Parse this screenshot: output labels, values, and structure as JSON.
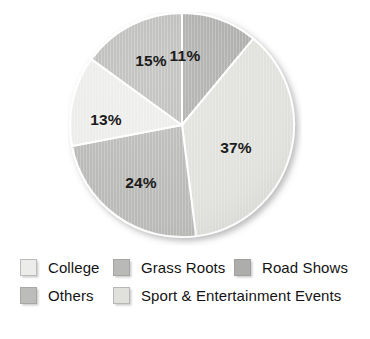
{
  "chart_data": {
    "type": "pie",
    "title": "",
    "subtitle": "",
    "xlabel": "",
    "ylabel": "",
    "grid": false,
    "legend_position": "bottom",
    "start_angle_deg": 0,
    "direction": "clockwise",
    "total": 100,
    "value_unit": "%",
    "categories": [
      "Road Shows",
      "Sport & Entertainment Events",
      "Grass Roots",
      "College",
      "Others"
    ],
    "values": [
      11,
      37,
      24,
      13,
      15
    ],
    "data_labels": [
      "11%",
      "37%",
      "24%",
      "13%",
      "15%"
    ],
    "slices": [
      {
        "label": "Road Shows",
        "value": 11,
        "data_label": "11%",
        "color": "#adadab",
        "start_deg": 0.0,
        "end_deg": 39.6,
        "label_x": 117,
        "label_y": 44
      },
      {
        "label": "Sport & Entertainment Events",
        "value": 37,
        "data_label": "37%",
        "color": "#e0e0dd",
        "start_deg": 39.6,
        "end_deg": 172.8,
        "label_x": 168,
        "label_y": 136
      },
      {
        "label": "Grass Roots",
        "value": 24,
        "data_label": "24%",
        "color": "#b9b9b7",
        "start_deg": 172.8,
        "end_deg": 259.2,
        "label_x": 73,
        "label_y": 171
      },
      {
        "label": "College",
        "value": 13,
        "data_label": "13%",
        "color": "#ececea",
        "start_deg": 259.2,
        "end_deg": 306.0,
        "label_x": 38,
        "label_y": 108
      },
      {
        "label": "Others",
        "value": 15,
        "data_label": "15%",
        "color": "#bcbcba",
        "start_deg": 306.0,
        "end_deg": 360.0,
        "label_x": 83,
        "label_y": 49
      }
    ]
  },
  "legend": {
    "rows": [
      [
        {
          "label": "College",
          "color": "#ececea"
        },
        {
          "label": "Grass Roots",
          "color": "#b9b9b7"
        },
        {
          "label": "Road Shows",
          "color": "#adadab"
        }
      ],
      [
        {
          "label": "Others",
          "color": "#bcbcba"
        },
        {
          "label": "Sport & Entertainment Events",
          "color": "#e0e0dd"
        }
      ]
    ]
  },
  "colors": {
    "background": "#ffffff",
    "label_text": "#1b1b1b",
    "legend_text": "#141414",
    "slice_road_shows": "#adadab",
    "slice_sport_entertainment": "#e0e0dd",
    "slice_grass_roots": "#b9b9b7",
    "slice_college": "#ececea",
    "slice_others": "#bcbcba"
  }
}
